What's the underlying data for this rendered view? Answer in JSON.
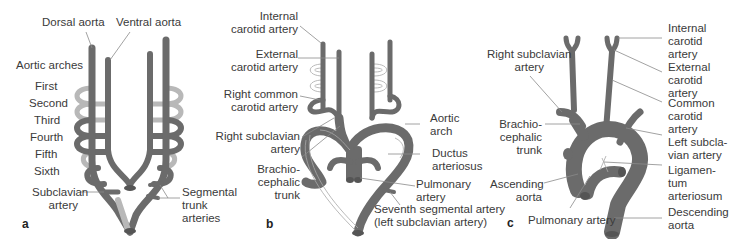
{
  "figure": {
    "colors": {
      "vessel": "#6b6b6b",
      "vessel_light": "#b8b8b8",
      "vessel_outline": "#9a9a9a",
      "leader": "#8a8a8a",
      "text": "#3a3a3a"
    },
    "panels": [
      {
        "letter": "a",
        "labels": {
          "dorsal_aorta": "Dorsal aorta",
          "ventral_aorta": "Ventral aorta",
          "aortic_arches": "Aortic arches",
          "first": "First",
          "second": "Second",
          "third": "Third",
          "fourth": "Fourth",
          "fifth": "Fifth",
          "sixth": "Sixth",
          "subclavian_1": "Subclavian",
          "subclavian_2": "artery",
          "segmental_1": "Segmental",
          "segmental_2": "trunk",
          "segmental_3": "arteries"
        }
      },
      {
        "letter": "b",
        "labels": {
          "internal_1": "Internal",
          "internal_2": "carotid artery",
          "external_1": "External",
          "external_2": "carotid artery",
          "rcc_1": "Right common",
          "rcc_2": "carotid artery",
          "rsub_1": "Right subclavian",
          "rsub_2": "artery",
          "brachio_1": "Brachio-",
          "brachio_2": "cephalic",
          "brachio_3": "trunk",
          "aortic_1": "Aortic",
          "aortic_2": "arch",
          "ductus_1": "Ductus",
          "ductus_2": "arteriosus",
          "pulm_1": "Pulmonary",
          "pulm_2": "artery",
          "seventh_1": "Seventh segmental artery",
          "seventh_2": "(left subclavian artery)"
        }
      },
      {
        "letter": "c",
        "labels": {
          "rsub_1": "Right subclavian",
          "rsub_2": "artery",
          "brachio_1": "Brachio-",
          "brachio_2": "cephalic",
          "brachio_3": "trunk",
          "ascending_1": "Ascending",
          "ascending_2": "aorta",
          "pulmonary": "Pulmonary artery",
          "internal_1": "Internal",
          "internal_2": "carotid",
          "internal_3": "artery",
          "external_1": "External",
          "external_2": "carotid",
          "external_3": "artery",
          "common_1": "Common",
          "common_2": "carotid",
          "common_3": "artery",
          "lsub_1": "Left subcla-",
          "lsub_2": "vian artery",
          "lig_1": "Ligamen-",
          "lig_2": "tum",
          "lig_3": "arteriosum",
          "desc_1": "Descending",
          "desc_2": "aorta"
        }
      }
    ]
  }
}
